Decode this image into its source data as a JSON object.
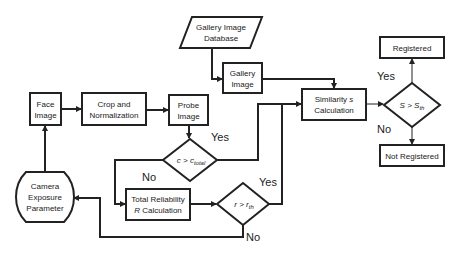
{
  "diagram": {
    "type": "flowchart",
    "nodes": {
      "face_image": {
        "line1": "Face",
        "line2": "Image"
      },
      "crop_norm": {
        "line1": "Crop and",
        "line2": "Normalization"
      },
      "probe_image": {
        "line1": "Probe",
        "line2": "Image"
      },
      "gallery_db": {
        "line1": "Gallery Image",
        "line2": "Database"
      },
      "gallery_image": {
        "line1": "Gallery",
        "line2": "Image"
      },
      "similarity": {
        "line1": "Similarity",
        "line1_var": "s",
        "line2": "Calculation"
      },
      "s_decision": {
        "lhs": "S",
        "op": ">",
        "rhs": "S",
        "rhs_sub": "th"
      },
      "registered": {
        "label": "Registered"
      },
      "not_registered": {
        "label": "Not Registered"
      },
      "c_decision": {
        "lhs": "c",
        "op": ">",
        "rhs": "c",
        "rhs_sub": "total"
      },
      "total_reliability": {
        "line1": "Total Reliability",
        "line2_var": "R",
        "line2": "Calculation"
      },
      "r_decision": {
        "lhs": "r",
        "op": ">",
        "rhs": "r",
        "rhs_sub": "th"
      },
      "camera_exposure": {
        "line1": "Camera",
        "line2": "Exposure",
        "line3": "Parameter"
      }
    },
    "edge_labels": {
      "s_yes": "Yes",
      "s_no": "No",
      "c_yes": "Yes",
      "c_no": "No",
      "r_yes": "Yes",
      "r_no": "No"
    },
    "edges": [
      {
        "from": "face_image",
        "to": "crop_norm"
      },
      {
        "from": "crop_norm",
        "to": "probe_image"
      },
      {
        "from": "probe_image",
        "to": "c_decision"
      },
      {
        "from": "gallery_db",
        "to": "gallery_image"
      },
      {
        "from": "gallery_image",
        "to": "similarity"
      },
      {
        "from": "c_decision",
        "to": "similarity",
        "label": "Yes"
      },
      {
        "from": "c_decision",
        "to": "total_reliability",
        "label": "No"
      },
      {
        "from": "total_reliability",
        "to": "r_decision"
      },
      {
        "from": "r_decision",
        "to": "similarity",
        "label": "Yes"
      },
      {
        "from": "r_decision",
        "to": "camera_exposure",
        "label": "No"
      },
      {
        "from": "camera_exposure",
        "to": "face_image"
      },
      {
        "from": "similarity",
        "to": "s_decision"
      },
      {
        "from": "s_decision",
        "to": "registered",
        "label": "Yes"
      },
      {
        "from": "s_decision",
        "to": "not_registered",
        "label": "No"
      }
    ]
  }
}
